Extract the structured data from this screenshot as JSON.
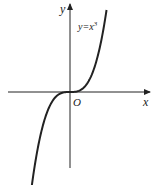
{
  "diagram": {
    "type": "function-graph",
    "function": "y = x^3",
    "curve_label": "y=x³",
    "x_axis_label": "x",
    "y_axis_label": "y",
    "origin_label": "O",
    "colors": {
      "ink": "#222222",
      "background": "#ffffff"
    }
  }
}
